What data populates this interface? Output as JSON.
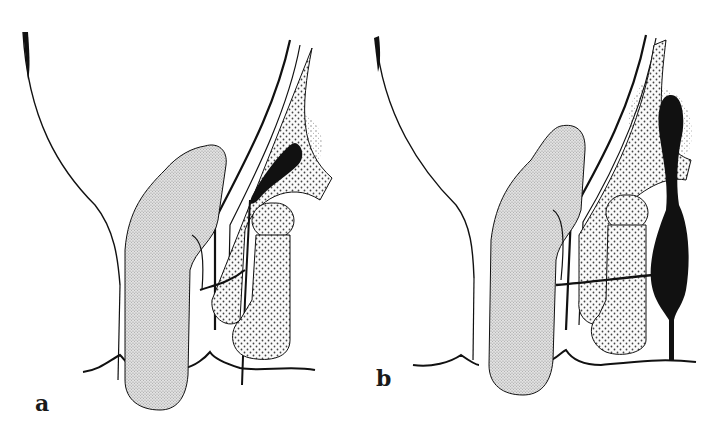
{
  "figure": {
    "panels": [
      {
        "id": "a",
        "label": "a"
      },
      {
        "id": "b",
        "label": "b"
      }
    ],
    "colors": {
      "ink": "#111111",
      "stipple_light": "#c8c8c8",
      "stipple_dot": "#555555",
      "background": "#ffffff"
    }
  }
}
